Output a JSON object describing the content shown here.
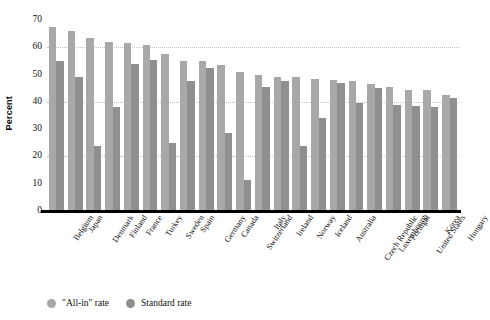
{
  "chart_data": {
    "type": "bar",
    "title": "",
    "xlabel": "",
    "ylabel": "Percent",
    "ylim": [
      0,
      70
    ],
    "yticks": [
      0,
      10,
      20,
      30,
      40,
      50,
      60,
      70
    ],
    "gridlines": [
      20,
      40,
      60
    ],
    "grid": "dotted-horizontal-faint",
    "legend_position": "bottom-left",
    "orientation": "vertical-grouped",
    "categories": [
      "Belgium",
      "Japan",
      "Denmark",
      "Finland",
      "France",
      "Turkey",
      "Sweden",
      "Spain",
      "Germany",
      "Canada",
      "Switzerland",
      "Italy",
      "Ireland",
      "Norway",
      "Iceland",
      "Australia",
      "Czech Republic",
      "Luxembourg",
      "Portugal",
      "United States",
      "Korea",
      "Hungary"
    ],
    "series": [
      {
        "name": "\"All-in\" rate",
        "color": "#a8a8a8",
        "values": [
          67.5,
          66,
          63.5,
          62,
          61.5,
          61,
          57.5,
          55,
          55,
          53.5,
          51,
          50,
          49,
          49,
          48.5,
          48,
          47.5,
          46.5,
          45.5,
          44.5,
          44.5,
          42.5
        ]
      },
      {
        "name": "Standard rate",
        "color": "#8f8f8f",
        "values": [
          55,
          49,
          24,
          38,
          54,
          55.5,
          25,
          47.5,
          52.5,
          28.5,
          11.5,
          45.5,
          47.5,
          24,
          34,
          47,
          39.5,
          45,
          39,
          38.5,
          38,
          41.5
        ]
      }
    ]
  },
  "axis": {
    "y_title": "Percent"
  },
  "legend": {
    "items": [
      {
        "label": "\"All-in\" rate",
        "color": "#a8a8a8"
      },
      {
        "label": "Standard rate",
        "color": "#8f8f8f"
      }
    ]
  },
  "colors": {
    "background": "#ffffff",
    "baseline": "#000000",
    "gridline": "#b9b9b9",
    "series_allin": "#a8a8a8",
    "series_standard": "#8f8f8f"
  }
}
